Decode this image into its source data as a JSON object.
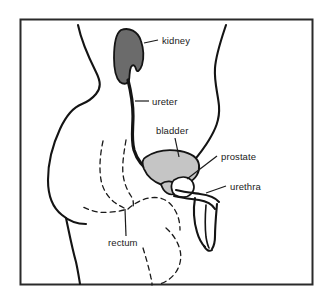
{
  "figure": {
    "frame": {
      "x": 20,
      "y": 19,
      "width": 293,
      "height": 266,
      "stroke_color": "#2a2a2a",
      "stroke_width": 2,
      "background_color": "#ffffff"
    },
    "style": {
      "ink_color": "#1a1a1a",
      "kidney_fill": "#6b6b6b",
      "bladder_fill": "#c5c5c5",
      "prostate_fill": "#ffffff",
      "body_outline_color": "#141414",
      "dashed_outline_color": "#1a1a1a",
      "leader_line_color": "#1a1a1a"
    },
    "labels": [
      {
        "id": "kidney",
        "text": "kidney",
        "text_x": 162,
        "text_y": 43,
        "anchor": "start",
        "leader": "M 156 39 L 143 42"
      },
      {
        "id": "ureter",
        "text": "ureter",
        "text_x": 152,
        "text_y": 104,
        "anchor": "start",
        "leader": "M 147 100 L 134 100"
      },
      {
        "id": "bladder",
        "text": "bladder",
        "text_x": 157,
        "text_y": 134,
        "anchor": "start",
        "leader": "M 172 138 L 176 158"
      },
      {
        "id": "prostate",
        "text": "prostate",
        "text_x": 220,
        "text_y": 159,
        "anchor": "start",
        "leader": "M 216 156 L 186 176"
      },
      {
        "id": "urethra",
        "text": "urethra",
        "text_x": 229,
        "text_y": 189,
        "anchor": "start",
        "leader": "M 225 186 L 205 192"
      },
      {
        "id": "rectum",
        "text": "rectum",
        "text_x": 110,
        "text_y": 244,
        "anchor": "start",
        "leader": "M 126 237 L 126 212"
      }
    ],
    "organs": [
      {
        "id": "kidney",
        "name": "kidney",
        "fill": "#6b6b6b"
      },
      {
        "id": "ureter",
        "name": "ureter",
        "fill": "none"
      },
      {
        "id": "bladder",
        "name": "bladder",
        "fill": "#c5c5c5"
      },
      {
        "id": "prostate",
        "name": "prostate",
        "fill": "#ffffff"
      },
      {
        "id": "urethra",
        "name": "urethra",
        "fill": "none"
      },
      {
        "id": "rectum",
        "name": "rectum",
        "fill": "none"
      }
    ]
  }
}
